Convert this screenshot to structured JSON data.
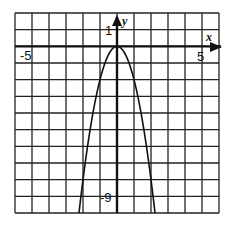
{
  "chart_data": {
    "type": "line",
    "title": "",
    "function": "y = -2x^2",
    "xlabel": "x",
    "ylabel": "y",
    "xlim": [
      -6,
      6
    ],
    "ylim": [
      -10,
      2
    ],
    "grid": true,
    "grid_step": 1,
    "tick_labels": {
      "x": [
        {
          "value": -5,
          "label": "-5"
        },
        {
          "value": 5,
          "label": "5"
        }
      ],
      "y": [
        {
          "value": 1,
          "label": "1"
        },
        {
          "value": -9,
          "label": "-9"
        }
      ]
    },
    "series": [
      {
        "name": "parabola",
        "x": [
          -2.236,
          -2,
          -1.5,
          -1,
          -0.5,
          0,
          0.5,
          1,
          1.5,
          2,
          2.236
        ],
        "y": [
          -10,
          -8,
          -4.5,
          -2,
          -0.5,
          0,
          -0.5,
          -2,
          -4.5,
          -8,
          -10
        ]
      }
    ],
    "vertex": [
      0,
      0
    ],
    "legend": null
  },
  "labels": {
    "x_axis": "x",
    "y_axis": "y",
    "x_neg": "-5",
    "x_pos": "5",
    "y_pos": "1",
    "y_neg": "-9"
  },
  "colors": {
    "grid": "#222222",
    "axis": "#111111",
    "curve": "#111111",
    "background": "#ffffff"
  }
}
